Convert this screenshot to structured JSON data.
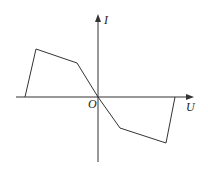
{
  "diagram": {
    "type": "I-U characteristic curve",
    "axes": {
      "x_label": "U",
      "y_label": "I",
      "origin_label": "O"
    },
    "curve_points_px": [
      [
        25,
        97
      ],
      [
        36,
        49
      ],
      [
        77,
        63
      ],
      [
        98,
        97
      ],
      [
        120,
        128
      ],
      [
        166,
        143
      ],
      [
        175,
        97
      ]
    ],
    "colors": {
      "line": "#333333",
      "background": "#ffffff"
    }
  }
}
